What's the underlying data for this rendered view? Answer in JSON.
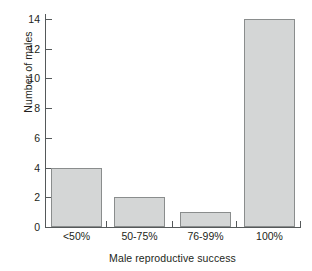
{
  "chart_data": {
    "type": "bar",
    "title": "",
    "xlabel": "Male reproductive success",
    "ylabel": "Number of males",
    "categories": [
      "<50%",
      "50-75%",
      "76-99%",
      "100%"
    ],
    "values": [
      4,
      2,
      1,
      14
    ],
    "ylim": [
      0,
      14
    ],
    "yticks": [
      0,
      2,
      4,
      6,
      8,
      10,
      12,
      14
    ],
    "ytick_labels": [
      "0",
      "2",
      "4",
      "6",
      "8",
      "10",
      "12",
      "14"
    ],
    "grid": false,
    "legend": null,
    "bar_fill_color": "#d4d6d6",
    "bar_edge_color": "#8a8d8d",
    "axis_color": "#55595a",
    "text_color": "#231f20"
  }
}
